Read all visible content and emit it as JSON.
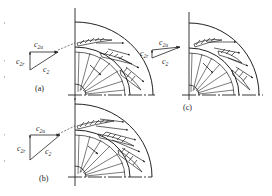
{
  "figure": {
    "panels": [
      {
        "id": "a",
        "caption": "(a)",
        "description": "Impeller with backward-curved blades; velocity triangle with large c2u",
        "triangle": {
          "c2u": "c",
          "c2u_sub": "2u",
          "c2r": "c",
          "c2r_sub": "2r",
          "c2": "c",
          "c2_sub": "2"
        }
      },
      {
        "id": "b",
        "caption": "(b)",
        "description": "Impeller with denser blading; velocity triangle with c2u and c2r",
        "triangle": {
          "c2u": "c",
          "c2u_sub": "2u",
          "c2r": "c",
          "c2r_sub": "2r",
          "c2": "c",
          "c2_sub": "2"
        }
      },
      {
        "id": "c",
        "caption": "(c)",
        "description": "Impeller with flatter exit flow; velocity triangle with small c2r",
        "triangle": {
          "c2u": "c",
          "c2u_sub": "2u",
          "c2r": "c",
          "c2r_sub": "2r",
          "c2": "c",
          "c2_sub": "2"
        }
      }
    ],
    "colors": {
      "ink": "#222222",
      "background": "#ffffff"
    }
  }
}
